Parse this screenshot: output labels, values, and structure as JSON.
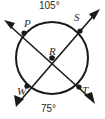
{
  "figure": {
    "type": "circle-with-intersecting-chords",
    "background_color": "#ffffff",
    "stroke_color": "#1a1a1a",
    "text_color": "#2b2b2b",
    "circle": {
      "cx": 52,
      "cy": 58,
      "r": 36
    },
    "points": {
      "P": {
        "label": "P",
        "x": 24,
        "y": 33,
        "description": "upper-left point on circle"
      },
      "S": {
        "label": "S",
        "x": 80,
        "y": 31,
        "description": "upper-right point on circle"
      },
      "W": {
        "label": "W",
        "x": 27,
        "y": 86,
        "description": "lower-left point on circle"
      },
      "T": {
        "label": "T",
        "x": 79,
        "y": 87,
        "description": "lower-right point on circle"
      },
      "R": {
        "label": "R",
        "x": 52,
        "y": 58,
        "description": "center intersection point"
      }
    },
    "arc_labels": {
      "top": "105°",
      "bottom": "75°"
    },
    "rays": [
      {
        "name": "ray-RP",
        "from": "R",
        "through": "P",
        "arrow_at": [
          6,
          22
        ]
      },
      {
        "name": "ray-RS",
        "from": "R",
        "through": "S",
        "arrow_at": [
          98,
          11
        ]
      },
      {
        "name": "ray-RW",
        "from": "R",
        "through": "W",
        "arrow_at": [
          18,
          104
        ]
      },
      {
        "name": "ray-RT",
        "from": "R",
        "through": "T",
        "arrow_at": [
          93,
          101
        ]
      }
    ]
  }
}
